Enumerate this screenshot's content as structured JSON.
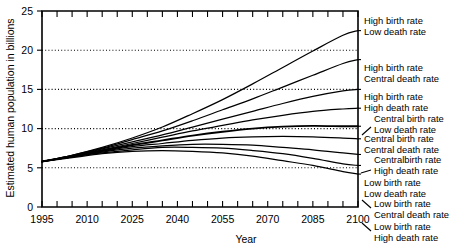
{
  "chart_data": {
    "type": "line",
    "title": "",
    "xlabel": "Year",
    "ylabel": "Estimated human population in billions",
    "xlim": [
      1995,
      2100
    ],
    "ylim": [
      0,
      25
    ],
    "xticks": [
      1995,
      2000,
      2005,
      2010,
      2015,
      2020,
      2025,
      2030,
      2035,
      2040,
      2045,
      2050,
      2055,
      2060,
      2065,
      2070,
      2075,
      2080,
      2085,
      2090,
      2095,
      2100
    ],
    "xtick_labels": [
      "1995",
      "2010",
      "2025",
      "2040",
      "2055",
      "2070",
      "2085",
      "2100"
    ],
    "xtick_label_values": [
      1995,
      2010,
      2025,
      2040,
      2055,
      2070,
      2085,
      2100
    ],
    "yticks": [
      0,
      5,
      10,
      15,
      20,
      25
    ],
    "ytick_labels": [
      "0",
      "5",
      "10",
      "15",
      "20",
      "25"
    ],
    "grid": "horizontal dotted gridlines at 5, 10, 15 and 20 billions",
    "gridlines": [
      5,
      10,
      15,
      20
    ],
    "legend_position": "right of plot, labels attached to curve endpoints",
    "x": [
      1995,
      2005,
      2015,
      2025,
      2035,
      2045,
      2055,
      2065,
      2075,
      2085,
      2095,
      2100
    ],
    "series": [
      {
        "name": "High birth rate / Low death rate",
        "birth_rate": "High",
        "death_rate": "Low",
        "end_value": 22.5,
        "values": [
          5.8,
          6.6,
          7.6,
          8.8,
          10.2,
          11.9,
          13.7,
          15.7,
          17.8,
          19.9,
          21.9,
          22.5
        ]
      },
      {
        "name": "High birth rate / Central death rate",
        "birth_rate": "High",
        "death_rate": "Central",
        "end_value": 18.8,
        "values": [
          5.8,
          6.6,
          7.5,
          8.6,
          9.7,
          11.0,
          12.4,
          13.8,
          15.3,
          16.8,
          18.3,
          18.8
        ]
      },
      {
        "name": "High birth rate / High death rate",
        "birth_rate": "High",
        "death_rate": "High",
        "end_value": 15.0,
        "values": [
          5.8,
          6.5,
          7.4,
          8.3,
          9.2,
          10.2,
          11.2,
          12.2,
          13.2,
          14.1,
          14.8,
          15.0
        ]
      },
      {
        "name": "Central birth rate / Low death rate",
        "birth_rate": "Central",
        "death_rate": "Low",
        "end_value": 12.6,
        "values": [
          5.8,
          6.5,
          7.3,
          8.1,
          8.9,
          9.7,
          10.4,
          11.1,
          11.7,
          12.2,
          12.5,
          12.6
        ]
      },
      {
        "name": "Central birth rate / Central death rate",
        "birth_rate": "Central",
        "death_rate": "Central",
        "end_value": 10.3,
        "values": [
          5.8,
          6.5,
          7.2,
          7.9,
          8.5,
          9.1,
          9.6,
          10.0,
          10.25,
          10.35,
          10.3,
          10.3
        ]
      },
      {
        "name": "Central birth rate / High death rate",
        "birth_rate": "Central",
        "death_rate": "High",
        "end_value": 8.7,
        "values": [
          5.8,
          6.4,
          7.1,
          7.7,
          8.1,
          8.5,
          8.8,
          8.95,
          9.0,
          8.95,
          8.8,
          8.7
        ]
      },
      {
        "name": "Low birth rate / Low death rate",
        "birth_rate": "Low",
        "death_rate": "Low",
        "end_value": 6.7,
        "values": [
          5.8,
          6.4,
          7.0,
          7.5,
          7.8,
          8.0,
          8.0,
          7.9,
          7.6,
          7.3,
          6.9,
          6.7
        ]
      },
      {
        "name": "Low birth rate / Central death rate",
        "birth_rate": "Low",
        "death_rate": "Central",
        "end_value": 5.3,
        "values": [
          5.8,
          6.4,
          6.9,
          7.3,
          7.6,
          7.6,
          7.5,
          7.2,
          6.8,
          6.2,
          5.5,
          5.3
        ]
      },
      {
        "name": "Low birth rate / High death rate",
        "birth_rate": "Low",
        "death_rate": "High",
        "end_value": 4.2,
        "values": [
          5.8,
          6.3,
          6.8,
          7.1,
          7.2,
          7.1,
          6.9,
          6.5,
          5.9,
          5.3,
          4.5,
          4.2
        ]
      }
    ],
    "annotations": [
      {
        "id": "ann-1",
        "line1": "High birth rate",
        "line2": "Low death rate",
        "leader": "none",
        "end_value": 22.5
      },
      {
        "id": "ann-2",
        "line1": "High birth rate",
        "line2": "Central death rate",
        "leader": "none",
        "end_value": 18.8
      },
      {
        "id": "ann-3",
        "line1": "High birth rate",
        "line2": "High death rate",
        "leader": "none",
        "end_value": 15.0
      },
      {
        "id": "ann-4",
        "line1": "Central birth rate",
        "line2": "Low death rate",
        "leader": "up-right",
        "end_value": 12.6
      },
      {
        "id": "ann-5",
        "line1": "Central birth rate",
        "line2": "Central death rate",
        "leader": "none",
        "end_value": 10.3
      },
      {
        "id": "ann-6",
        "line1": "Centralbirth rate",
        "line2": "High death rate",
        "leader": "dash",
        "end_value": 8.7
      },
      {
        "id": "ann-7",
        "line1": "Low birth rate",
        "line2": "Low death rate",
        "leader": "none",
        "end_value": 6.7
      },
      {
        "id": "ann-8",
        "line1": "Low birth rate",
        "line2": "Central death rate",
        "leader": "down-right",
        "end_value": 5.3
      },
      {
        "id": "ann-9",
        "line1": "Low birth rate",
        "line2": "High death rate",
        "leader": "down-right2",
        "end_value": 4.2
      }
    ]
  }
}
